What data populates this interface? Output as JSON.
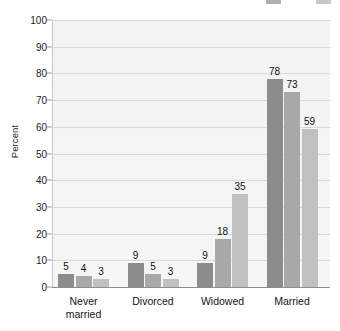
{
  "chart_data": {
    "type": "bar",
    "title": "Men",
    "xlabel": "",
    "ylabel": "Percent",
    "ylim": [
      0,
      100
    ],
    "ytick_step": 10,
    "ytick_labels": [
      "0",
      "10",
      "20",
      "30",
      "40",
      "50",
      "60",
      "70",
      "80",
      "90",
      "100"
    ],
    "grid": true,
    "legend_position": "top-right",
    "categories": [
      "Never\nmarried",
      "Divorced",
      "Widowed",
      "Married"
    ],
    "series": [
      {
        "name": "series-1",
        "color": "#8c8c8c",
        "values": [
          5,
          9,
          9,
          78
        ]
      },
      {
        "name": "series-2",
        "color": "#a8a8a8",
        "values": [
          4,
          5,
          18,
          73
        ]
      },
      {
        "name": "series-3",
        "color": "#c0c0c0",
        "values": [
          3,
          3,
          35,
          59
        ]
      }
    ],
    "legend_swatches": [
      {
        "name": "legend-swatch-1",
        "color": "#6f6f6f",
        "x": 266
      },
      {
        "name": "legend-swatch-2",
        "color": "#9b9b9b",
        "x": 316
      }
    ],
    "plot_background": "#f4f4f4",
    "gridline_color": "#d9d9d9",
    "axis_color": "#8d8d8d"
  }
}
